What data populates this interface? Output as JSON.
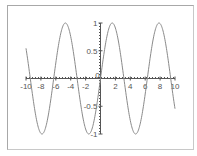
{
  "chart_data": {
    "type": "line",
    "title": "",
    "xlabel": "",
    "ylabel": "",
    "xlim": [
      -10,
      10
    ],
    "ylim": [
      -1,
      1
    ],
    "grid": false,
    "legend": null,
    "function": "sin(x)",
    "series": [
      {
        "name": "sin(x)",
        "color": "#8a8a8a",
        "x": [
          -10,
          -9,
          -8,
          -7,
          -6,
          -5,
          -4,
          -3,
          -2,
          -1,
          0,
          1,
          2,
          3,
          4,
          5,
          6,
          7,
          8,
          9,
          10
        ],
        "y": [
          0.544,
          -0.412,
          -0.989,
          -0.657,
          0.279,
          0.959,
          0.757,
          -0.141,
          -0.909,
          -0.841,
          0,
          0.841,
          0.909,
          0.141,
          -0.757,
          -0.959,
          -0.279,
          0.657,
          0.989,
          0.412,
          -0.544
        ]
      }
    ],
    "x_ticks": [
      "-10",
      "-8",
      "-6",
      "-4",
      "-2",
      "0",
      "2",
      "4",
      "6",
      "8",
      "10"
    ],
    "y_ticks": [
      "-1",
      "-0.5",
      "0.5",
      "1"
    ]
  },
  "axes": {
    "axis_color": "#555555",
    "line_color": "#8a8a8a"
  }
}
